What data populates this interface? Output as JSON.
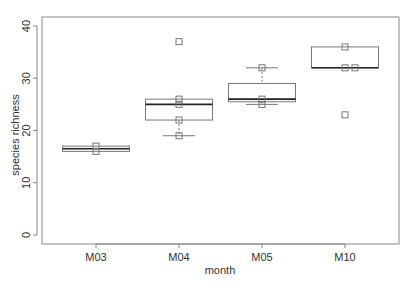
{
  "chart_data": {
    "type": "box",
    "title": "",
    "xlabel": "month",
    "ylabel": "species richness",
    "ylim": [
      0,
      40
    ],
    "yticks": [
      0,
      10,
      20,
      30,
      40
    ],
    "grid": false,
    "legend": null,
    "categories": [
      "M03",
      "M04",
      "M05",
      "M10"
    ],
    "boxes": [
      {
        "category": "M03",
        "whisker_low": 16,
        "q1": 16,
        "median": 16.5,
        "q3": 17,
        "whisker_high": 17,
        "points": [
          16,
          17
        ],
        "outliers": []
      },
      {
        "category": "M04",
        "whisker_low": 19,
        "q1": 22,
        "median": 25,
        "q3": 26,
        "whisker_high": 26,
        "points": [
          19,
          22,
          25,
          26
        ],
        "outliers": [
          37
        ]
      },
      {
        "category": "M05",
        "whisker_low": 25,
        "q1": 25.5,
        "median": 26,
        "q3": 29,
        "whisker_high": 32,
        "points": [
          25,
          26,
          32
        ],
        "outliers": []
      },
      {
        "category": "M10",
        "whisker_low": 32,
        "q1": 32,
        "median": 32,
        "q3": 36,
        "whisker_high": 36,
        "points": [
          32,
          32,
          36
        ],
        "outliers": [
          23
        ]
      }
    ]
  },
  "axes": {
    "xlabel": "month",
    "ylabel": "species richness",
    "yticks": [
      "0",
      "10",
      "20",
      "30",
      "40"
    ],
    "xticks": [
      "M03",
      "M04",
      "M05",
      "M10"
    ]
  }
}
